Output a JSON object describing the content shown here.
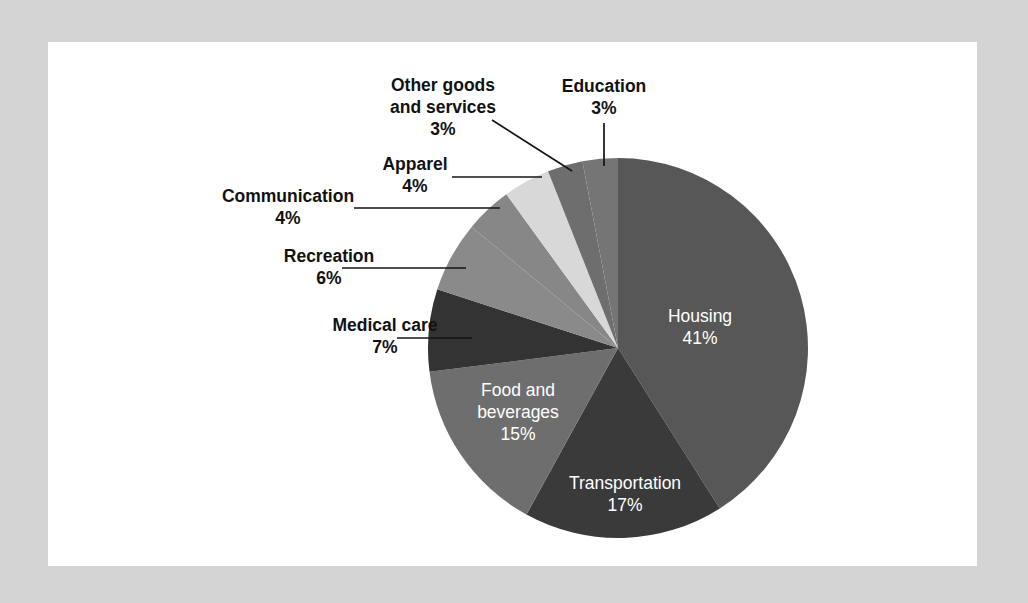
{
  "canvas": {
    "width": 1028,
    "height": 603,
    "background_color": "#d4d4d4",
    "card_color": "#ffffff"
  },
  "chart_data": {
    "type": "pie",
    "title": "",
    "subtitle": "",
    "xlabel": "",
    "ylabel": "",
    "legend_position": "none",
    "grid": false,
    "start_angle_deg": 0,
    "direction": "clockwise",
    "value_unit": "%",
    "categories": [
      "Housing",
      "Transportation",
      "Food and beverages",
      "Medical care",
      "Recreation",
      "Communication",
      "Apparel",
      "Other goods and services",
      "Education"
    ],
    "values": [
      41,
      17,
      15,
      7,
      6,
      4,
      4,
      3,
      3
    ],
    "total": 100,
    "colors": [
      "#575757",
      "#3a3a3a",
      "#6e6e6e",
      "#333333",
      "#8a8a8a",
      "#878787",
      "#d8d8d8",
      "#6e6e6e",
      "#757575"
    ]
  },
  "slices": [
    {
      "name": "housing",
      "label_line1": "Housing",
      "label_line2": "",
      "percent_text": "41%",
      "value": 41,
      "color": "#575757",
      "label_style": "inside",
      "label_x": 700,
      "label_y": 322,
      "pct_x": 700,
      "pct_y": 344
    },
    {
      "name": "transportation",
      "label_line1": "Transportation",
      "label_line2": "",
      "percent_text": "17%",
      "value": 17,
      "color": "#3a3a3a",
      "label_style": "inside",
      "label_x": 625,
      "label_y": 489,
      "pct_x": 625,
      "pct_y": 511
    },
    {
      "name": "food-and-beverages",
      "label_line1": "Food and",
      "label_line2": "beverages",
      "percent_text": "15%",
      "value": 15,
      "color": "#6e6e6e",
      "label_style": "inside",
      "label_x": 518,
      "label_y": 396,
      "pct_x": 518,
      "pct_y": 440
    },
    {
      "name": "medical-care",
      "label_line1": "Medical care",
      "label_line2": "",
      "percent_text": "7%",
      "value": 7,
      "color": "#333333",
      "label_style": "callout",
      "label_x": 385,
      "label_y": 331,
      "pct_x": 385,
      "pct_y": 353,
      "leader": {
        "x1": 397,
        "y1": 338,
        "x2": 472,
        "y2": 338
      }
    },
    {
      "name": "recreation",
      "label_line1": "Recreation",
      "label_line2": "",
      "percent_text": "6%",
      "value": 6,
      "color": "#8a8a8a",
      "label_style": "callout",
      "label_x": 329,
      "label_y": 262,
      "pct_x": 329,
      "pct_y": 284,
      "leader": {
        "x1": 342,
        "y1": 268,
        "x2": 466,
        "y2": 268
      }
    },
    {
      "name": "communication",
      "label_line1": "Communication",
      "label_line2": "",
      "percent_text": "4%",
      "value": 4,
      "color": "#878787",
      "label_style": "callout",
      "label_x": 288,
      "label_y": 202,
      "pct_x": 288,
      "pct_y": 224,
      "leader": {
        "x1": 354,
        "y1": 208,
        "x2": 500,
        "y2": 208
      }
    },
    {
      "name": "apparel",
      "label_line1": "Apparel",
      "label_line2": "",
      "percent_text": "4%",
      "value": 4,
      "color": "#d8d8d8",
      "label_style": "callout",
      "label_x": 415,
      "label_y": 170,
      "pct_x": 415,
      "pct_y": 192,
      "leader": {
        "x1": 452,
        "y1": 177,
        "x2": 542,
        "y2": 177
      }
    },
    {
      "name": "other-goods-and-services",
      "label_line1": "Other goods",
      "label_line2": "and services",
      "percent_text": "3%",
      "value": 3,
      "color": "#6e6e6e",
      "label_style": "callout",
      "label_x": 443,
      "label_y": 91,
      "pct_x": 443,
      "pct_y": 135,
      "leader": {
        "x1": 492,
        "y1": 120,
        "x2": 572,
        "y2": 171
      }
    },
    {
      "name": "education",
      "label_line1": "Education",
      "label_line2": "",
      "percent_text": "3%",
      "value": 3,
      "color": "#757575",
      "label_style": "callout",
      "label_x": 604,
      "label_y": 92,
      "pct_x": 604,
      "pct_y": 114,
      "leader": {
        "x1": 604,
        "y1": 123,
        "x2": 604,
        "y2": 166
      }
    }
  ],
  "geometry": {
    "center_x": 618,
    "center_y": 348,
    "radius": 190
  }
}
